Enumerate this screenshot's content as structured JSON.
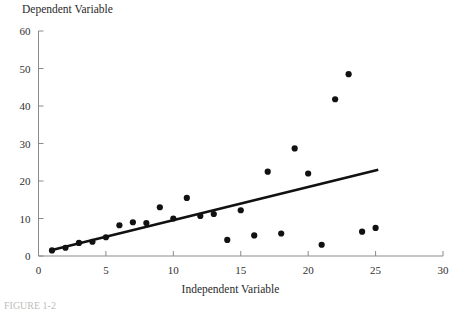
{
  "chart_data": {
    "type": "scatter",
    "title": "",
    "xlabel": "Independent Variable",
    "ylabel": "Dependent Variable",
    "xlim": [
      0,
      30
    ],
    "ylim": [
      0,
      60
    ],
    "xticks": [
      0,
      5,
      10,
      15,
      20,
      25,
      30
    ],
    "yticks": [
      0,
      10,
      20,
      30,
      40,
      50,
      60
    ],
    "xtick_labels": [
      "0",
      "5",
      "10",
      "15",
      "20",
      "25",
      "30"
    ],
    "ytick_labels": [
      "0",
      "10",
      "20",
      "30",
      "40",
      "50",
      "60"
    ],
    "grid": false,
    "legend": false,
    "series": [
      {
        "name": "observations",
        "marker": "filled-circle",
        "color": "#111111",
        "points": [
          {
            "x": 1,
            "y": 1.5
          },
          {
            "x": 2,
            "y": 2.2
          },
          {
            "x": 3,
            "y": 3.5
          },
          {
            "x": 4,
            "y": 3.8
          },
          {
            "x": 5,
            "y": 5.0
          },
          {
            "x": 6,
            "y": 8.2
          },
          {
            "x": 7,
            "y": 9.0
          },
          {
            "x": 8,
            "y": 8.8
          },
          {
            "x": 9,
            "y": 13.0
          },
          {
            "x": 10,
            "y": 10.0
          },
          {
            "x": 11,
            "y": 15.5
          },
          {
            "x": 12,
            "y": 10.7
          },
          {
            "x": 13,
            "y": 11.2
          },
          {
            "x": 14,
            "y": 4.3
          },
          {
            "x": 15,
            "y": 12.2
          },
          {
            "x": 16,
            "y": 5.5
          },
          {
            "x": 17,
            "y": 22.5
          },
          {
            "x": 18,
            "y": 6.0
          },
          {
            "x": 19,
            "y": 28.7
          },
          {
            "x": 20,
            "y": 22.0
          },
          {
            "x": 21,
            "y": 3.0
          },
          {
            "x": 22,
            "y": 41.8
          },
          {
            "x": 23,
            "y": 48.5
          },
          {
            "x": 24,
            "y": 6.5
          },
          {
            "x": 25,
            "y": 7.5
          }
        ]
      }
    ],
    "trendline": {
      "name": "fitted-regression-line",
      "color": "#111111",
      "x_start": 1,
      "y_start": 1.6,
      "x_end": 25.2,
      "y_end": 23.0
    }
  },
  "labels": {
    "y_axis_title": "Dependent Variable",
    "x_axis_title": "Independent Variable",
    "caption": "FIGURE 1-2"
  }
}
